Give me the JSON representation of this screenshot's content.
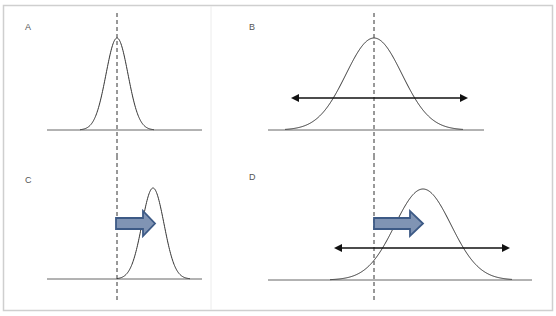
{
  "figure": {
    "colors": {
      "frame": "#cfcfcf",
      "divider": "#e6e6e6",
      "curve": "#333333",
      "baseline": "#666666",
      "reference_line": "#333333",
      "double_arrow": "#111111",
      "block_arrow_fill": "#8094b4",
      "block_arrow_stroke": "#3d5a86"
    },
    "panels": [
      {
        "id": "A",
        "label": "A",
        "shift_arrow": false,
        "spread_arrow": false
      },
      {
        "id": "B",
        "label": "B",
        "shift_arrow": false,
        "spread_arrow": true
      },
      {
        "id": "C",
        "label": "C",
        "shift_arrow": true,
        "spread_arrow": false
      },
      {
        "id": "D",
        "label": "D",
        "shift_arrow": true,
        "spread_arrow": true
      }
    ]
  }
}
